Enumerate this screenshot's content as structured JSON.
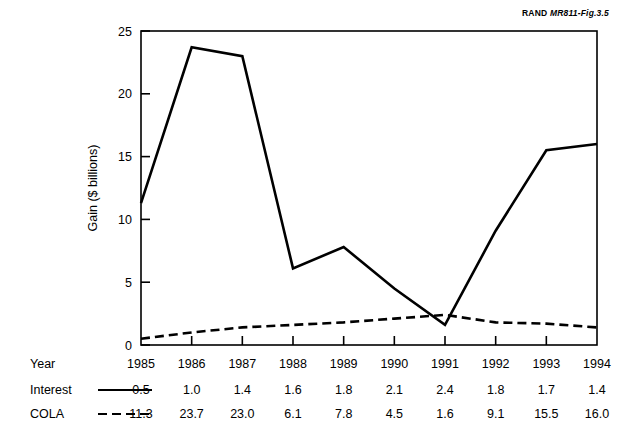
{
  "figure": {
    "source_tag_prefix": "RAND ",
    "source_tag_id": "MR811-Fig.3.5"
  },
  "chart_data": {
    "type": "line",
    "title": "",
    "xlabel": "Year",
    "ylabel": "Gain ($ billions)",
    "x": [
      1985,
      1986,
      1987,
      1988,
      1989,
      1990,
      1991,
      1992,
      1993,
      1994
    ],
    "xtick_labels": [
      "1985",
      "1986",
      "1987",
      "1988",
      "1989",
      "1990",
      "1991",
      "1992",
      "1993",
      "1994"
    ],
    "ytick_labels": [
      "0",
      "5",
      "10",
      "15",
      "20",
      "25"
    ],
    "yticks": [
      0,
      5,
      10,
      15,
      20,
      25
    ],
    "ylim": [
      0,
      25
    ],
    "xlim": [
      1985,
      1994
    ],
    "grid": false,
    "legend_position": "bottom-table",
    "series": [
      {
        "name": "Interest",
        "style": "solid",
        "color": "#000000",
        "values": [
          0.5,
          1.0,
          1.4,
          1.6,
          1.8,
          2.1,
          2.4,
          1.8,
          1.7,
          1.4
        ],
        "plotted_values": [
          11.3,
          23.7,
          23.0,
          6.1,
          7.8,
          4.5,
          1.6,
          9.1,
          15.5,
          16.0
        ]
      },
      {
        "name": "COLA",
        "style": "dashed",
        "color": "#000000",
        "values": [
          11.3,
          23.7,
          23.0,
          6.1,
          7.8,
          4.5,
          1.6,
          9.1,
          15.5,
          16.0
        ],
        "plotted_values": [
          0.5,
          1.0,
          1.4,
          1.6,
          1.8,
          2.1,
          2.4,
          1.8,
          1.7,
          1.4
        ]
      }
    ]
  },
  "table": {
    "rows": [
      {
        "label": "Year",
        "legend_style": "none",
        "cells": [
          "1985",
          "1986",
          "1987",
          "1988",
          "1989",
          "1990",
          "1991",
          "1992",
          "1993",
          "1994"
        ]
      },
      {
        "label": "Interest",
        "legend_style": "solid",
        "cells": [
          "0.5",
          "1.0",
          "1.4",
          "1.6",
          "1.8",
          "2.1",
          "2.4",
          "1.8",
          "1.7",
          "1.4"
        ]
      },
      {
        "label": "COLA",
        "legend_style": "dashed",
        "cells": [
          "11.3",
          "23.7",
          "23.0",
          "6.1",
          "7.8",
          "4.5",
          "1.6",
          "9.1",
          "15.5",
          "16.0"
        ]
      }
    ]
  }
}
